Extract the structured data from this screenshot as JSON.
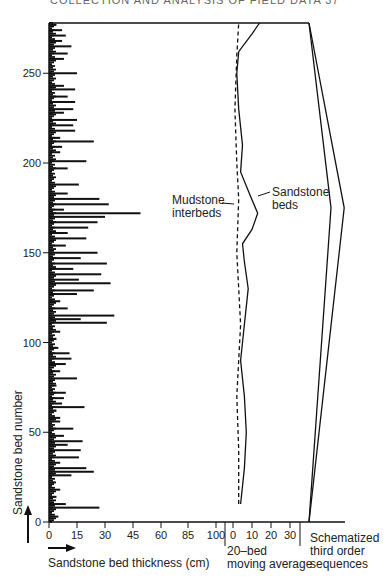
{
  "page_header": "COLLECTION AND ANALYSIS OF FIELD DATA 37",
  "chart_data": [
    {
      "type": "bar",
      "orientation": "horizontal",
      "title": "",
      "xlabel": "Sandstone bed thickness (cm)",
      "ylabel": "Sandstone bed number",
      "x_ticks": [
        0,
        15,
        30,
        45,
        60,
        85,
        100
      ],
      "y_ticks": [
        0,
        50,
        100,
        150,
        200,
        250
      ],
      "ylim": [
        0,
        278
      ],
      "grid": false,
      "note": "Approximate bed thicknesses read per bed (selected prominent beds)",
      "beds": [
        {
          "bed": 3,
          "thickness": 5
        },
        {
          "bed": 8,
          "thickness": 27
        },
        {
          "bed": 10,
          "thickness": 9
        },
        {
          "bed": 14,
          "thickness": 4
        },
        {
          "bed": 18,
          "thickness": 6
        },
        {
          "bed": 22,
          "thickness": 3
        },
        {
          "bed": 26,
          "thickness": 12
        },
        {
          "bed": 28,
          "thickness": 24
        },
        {
          "bed": 30,
          "thickness": 20
        },
        {
          "bed": 33,
          "thickness": 6
        },
        {
          "bed": 36,
          "thickness": 16
        },
        {
          "bed": 40,
          "thickness": 17
        },
        {
          "bed": 43,
          "thickness": 10
        },
        {
          "bed": 45,
          "thickness": 18
        },
        {
          "bed": 48,
          "thickness": 8
        },
        {
          "bed": 52,
          "thickness": 13
        },
        {
          "bed": 56,
          "thickness": 6
        },
        {
          "bed": 58,
          "thickness": 6
        },
        {
          "bed": 62,
          "thickness": 4
        },
        {
          "bed": 64,
          "thickness": 19
        },
        {
          "bed": 66,
          "thickness": 7
        },
        {
          "bed": 69,
          "thickness": 8
        },
        {
          "bed": 72,
          "thickness": 9
        },
        {
          "bed": 76,
          "thickness": 4
        },
        {
          "bed": 80,
          "thickness": 15
        },
        {
          "bed": 84,
          "thickness": 6
        },
        {
          "bed": 88,
          "thickness": 9
        },
        {
          "bed": 91,
          "thickness": 12
        },
        {
          "bed": 94,
          "thickness": 11
        },
        {
          "bed": 97,
          "thickness": 5
        },
        {
          "bed": 102,
          "thickness": 4
        },
        {
          "bed": 106,
          "thickness": 6
        },
        {
          "bed": 111,
          "thickness": 31
        },
        {
          "bed": 113,
          "thickness": 17
        },
        {
          "bed": 115,
          "thickness": 35
        },
        {
          "bed": 119,
          "thickness": 10
        },
        {
          "bed": 123,
          "thickness": 6
        },
        {
          "bed": 127,
          "thickness": 15
        },
        {
          "bed": 129,
          "thickness": 24
        },
        {
          "bed": 133,
          "thickness": 33
        },
        {
          "bed": 135,
          "thickness": 16
        },
        {
          "bed": 138,
          "thickness": 28
        },
        {
          "bed": 141,
          "thickness": 13
        },
        {
          "bed": 144,
          "thickness": 31
        },
        {
          "bed": 147,
          "thickness": 17
        },
        {
          "bed": 150,
          "thickness": 26
        },
        {
          "bed": 154,
          "thickness": 9
        },
        {
          "bed": 158,
          "thickness": 20
        },
        {
          "bed": 161,
          "thickness": 10
        },
        {
          "bed": 164,
          "thickness": 21
        },
        {
          "bed": 167,
          "thickness": 26
        },
        {
          "bed": 170,
          "thickness": 30
        },
        {
          "bed": 172,
          "thickness": 49
        },
        {
          "bed": 174,
          "thickness": 8
        },
        {
          "bed": 177,
          "thickness": 32
        },
        {
          "bed": 180,
          "thickness": 27
        },
        {
          "bed": 183,
          "thickness": 10
        },
        {
          "bed": 188,
          "thickness": 16
        },
        {
          "bed": 193,
          "thickness": 2
        },
        {
          "bed": 197,
          "thickness": 10
        },
        {
          "bed": 201,
          "thickness": 20
        },
        {
          "bed": 206,
          "thickness": 6
        },
        {
          "bed": 209,
          "thickness": 7
        },
        {
          "bed": 212,
          "thickness": 24
        },
        {
          "bed": 214,
          "thickness": 6
        },
        {
          "bed": 218,
          "thickness": 14
        },
        {
          "bed": 221,
          "thickness": 13
        },
        {
          "bed": 224,
          "thickness": 15
        },
        {
          "bed": 228,
          "thickness": 8
        },
        {
          "bed": 230,
          "thickness": 13
        },
        {
          "bed": 234,
          "thickness": 14
        },
        {
          "bed": 237,
          "thickness": 10
        },
        {
          "bed": 241,
          "thickness": 14
        },
        {
          "bed": 243,
          "thickness": 8
        },
        {
          "bed": 250,
          "thickness": 15
        },
        {
          "bed": 258,
          "thickness": 8
        },
        {
          "bed": 261,
          "thickness": 10
        },
        {
          "bed": 265,
          "thickness": 12
        },
        {
          "bed": 268,
          "thickness": 7
        },
        {
          "bed": 271,
          "thickness": 9
        },
        {
          "bed": 274,
          "thickness": 7
        },
        {
          "bed": 277,
          "thickness": 4
        }
      ]
    },
    {
      "type": "line",
      "title": "",
      "xlabel": "20–bed moving average",
      "x_ticks": [
        0,
        10,
        20,
        30
      ],
      "ylim": [
        0,
        278
      ],
      "series": [
        {
          "name": "Sandstone beds",
          "style": "solid",
          "points": [
            [
              4,
              10
            ],
            [
              6,
              30
            ],
            [
              7,
              50
            ],
            [
              6,
              70
            ],
            [
              4,
              90
            ],
            [
              5,
              100
            ],
            [
              6,
              110
            ],
            [
              8,
              130
            ],
            [
              6,
              145
            ],
            [
              5,
              155
            ],
            [
              10,
              163
            ],
            [
              13,
              172
            ],
            [
              9,
              182
            ],
            [
              4,
              195
            ],
            [
              5,
              210
            ],
            [
              3,
              230
            ],
            [
              2,
              250
            ],
            [
              3,
              262
            ],
            [
              10,
              272
            ],
            [
              14,
              278
            ]
          ]
        },
        {
          "name": "Mudstone interbeds",
          "style": "dashed",
          "points": [
            [
              3,
              10
            ],
            [
              3,
              40
            ],
            [
              2,
              70
            ],
            [
              3,
              90
            ],
            [
              4,
              110
            ],
            [
              3,
              130
            ],
            [
              2,
              150
            ],
            [
              3,
              180
            ],
            [
              2,
              200
            ],
            [
              1,
              230
            ],
            [
              2,
              260
            ],
            [
              3,
              278
            ]
          ]
        }
      ],
      "annotations": [
        "Sandstone beds",
        "Mudstone interbeds"
      ]
    },
    {
      "type": "line",
      "title": "",
      "xlabel": "Schematized third order sequences",
      "series": [
        {
          "name": "inner envelope",
          "points": [
            [
              0,
              0
            ],
            [
              1,
              175
            ],
            [
              0,
              278
            ]
          ]
        },
        {
          "name": "outer envelope",
          "points": [
            [
              0,
              0
            ],
            [
              1.6,
              175
            ],
            [
              0,
              278
            ]
          ]
        }
      ]
    }
  ],
  "labels": {
    "y_axis": "Sandstone bed number",
    "x_axis": "Sandstone bed thickness (cm)",
    "moving_avg_line1": "20–bed",
    "moving_avg_line2": "moving average",
    "schematic_line1": "Schematized",
    "schematic_line2": "third order",
    "schematic_line3": "sequences",
    "sandstone_line1": "Sandstone",
    "sandstone_line2": "beds",
    "mudstone_line1": "Mudstone",
    "mudstone_line2": "interbeds"
  }
}
